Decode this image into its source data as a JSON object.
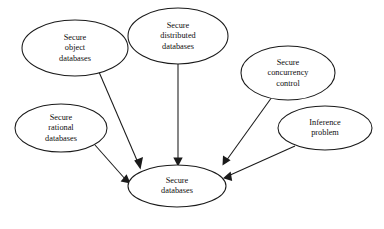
{
  "diagram": {
    "type": "node-arrow-diagram",
    "background_color": "#ffffff",
    "stroke_color": "#1a1a1a",
    "text_color": "#0d0d0d",
    "nodes": [
      {
        "id": "secure-object-databases",
        "shape": "ellipse",
        "cx": 75,
        "cy": 48,
        "rx": 53,
        "ry": 28,
        "lines": [
          "Secure",
          "object",
          "databases"
        ],
        "line1": "Secure",
        "line2": "object",
        "line3": "databases"
      },
      {
        "id": "secure-distributed-databases",
        "shape": "ellipse",
        "cx": 178,
        "cy": 36,
        "rx": 50,
        "ry": 28,
        "lines": [
          "Secure",
          "distributed",
          "databases"
        ],
        "line1": "Secure",
        "line2": "distributed",
        "line3": "databases"
      },
      {
        "id": "secure-concurrency-control",
        "shape": "ellipse",
        "cx": 288,
        "cy": 73,
        "rx": 47,
        "ry": 27,
        "lines": [
          "Secure",
          "concurrency",
          "control"
        ],
        "line1": "Secure",
        "line2": "concurrency",
        "line3": "control"
      },
      {
        "id": "inference-problem",
        "shape": "ellipse",
        "cx": 325,
        "cy": 128,
        "rx": 47,
        "ry": 22,
        "lines": [
          "Inference",
          "problem"
        ],
        "line1": "Inference",
        "line2": "problem"
      },
      {
        "id": "secure-rational-databases",
        "shape": "ellipse",
        "cx": 61,
        "cy": 128,
        "rx": 46,
        "ry": 24,
        "lines": [
          "Secure",
          "rational",
          "databases"
        ],
        "line1": "Secure",
        "line2": "rational",
        "line3": "databases"
      },
      {
        "id": "secure-databases",
        "shape": "ellipse",
        "cx": 177,
        "cy": 186,
        "rx": 49,
        "ry": 21,
        "lines": [
          "Secure",
          "databases"
        ],
        "line1": "Secure",
        "line2": "databases"
      }
    ],
    "edges": [
      {
        "id": "edge-object-to-secure",
        "from": "secure-object-databases",
        "to": "secure-databases",
        "arrow": "filled-triangle"
      },
      {
        "id": "edge-distributed-to-secure",
        "from": "secure-distributed-databases",
        "to": "secure-databases",
        "arrow": "filled-triangle"
      },
      {
        "id": "edge-rational-to-secure",
        "from": "secure-rational-databases",
        "to": "secure-databases",
        "arrow": "filled-triangle"
      },
      {
        "id": "edge-concurrency-to-secure",
        "from": "secure-concurrency-control",
        "to": "secure-databases",
        "arrow": "filled-triangle"
      },
      {
        "id": "edge-inference-to-secure",
        "from": "inference-problem",
        "to": "secure-databases",
        "arrow": "filled-triangle"
      }
    ]
  }
}
